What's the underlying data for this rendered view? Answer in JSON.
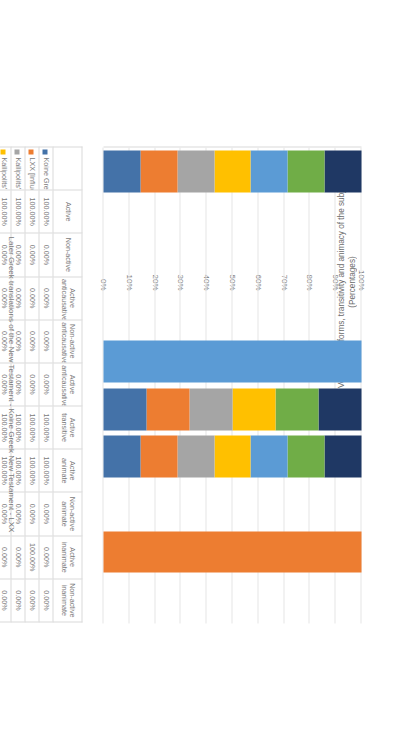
{
  "chart_data": {
    "type": "bar",
    "stacked": true,
    "title": "Later Greek translations of the New Testament - Koine Greek New Testament - LXX",
    "xlabel": "",
    "ylabel": "Voice verbal forms, transitivity and animacy of the subjects (Percentages)",
    "ylim": [
      0,
      100
    ],
    "ytick_labels": [
      "100%",
      "90%",
      "80%",
      "70%",
      "60%",
      "50%",
      "40%",
      "30%",
      "20%",
      "10%",
      "0%"
    ],
    "ytick_values": [
      100,
      90,
      80,
      70,
      60,
      50,
      40,
      30,
      20,
      10,
      0
    ],
    "grid": true,
    "legend_position": "bottom",
    "categories": [
      "Active",
      "Non-active",
      "Active anticausative",
      "Non-active anticausative",
      "Active anticausative",
      "Active transitive",
      "Active animate",
      "Non-active animate",
      "Active inanimate",
      "Non-active inanimate"
    ],
    "series": [
      {
        "name": "Koine Greek New Testament  [Source text]",
        "color": "#4472a8",
        "values": [
          100.0,
          0.0,
          0.0,
          0.0,
          0.0,
          100.0,
          100.0,
          0.0,
          0.0,
          0.0
        ]
      },
      {
        "name": "LXX [Influence on the source and target texts]",
        "color": "#ed7d31",
        "values": [
          100.0,
          0.0,
          0.0,
          0.0,
          0.0,
          100.0,
          100.0,
          0.0,
          100.0,
          0.0
        ]
      },
      {
        "name": "Kallipolits' New Testament  [17th century]",
        "color": "#a5a5a5",
        "values": [
          100.0,
          0.0,
          0.0,
          0.0,
          0.0,
          100.0,
          100.0,
          0.0,
          0.0,
          0.0
        ]
      },
      {
        "name": "Kallipolits' New Testament  [iatrevo] [17th century]",
        "color": "#ffc000",
        "values": [
          100.0,
          0.0,
          0.0,
          0.0,
          0.0,
          100.0,
          100.0,
          0.0,
          0.0,
          0.0
        ]
      },
      {
        "name": "Vamvas' New Testament  [19th century]",
        "color": "#5b9bd5",
        "values": [
          100.0,
          0.0,
          0.0,
          0.0,
          100.0,
          0.0,
          100.0,
          0.0,
          0.0,
          0.0
        ]
      },
      {
        "name": "Today's Greek Version  [20th century]",
        "color": "#70ad47",
        "values": [
          100.0,
          0.0,
          0.0,
          0.0,
          0.0,
          100.0,
          100.0,
          0.0,
          0.0,
          0.0
        ]
      },
      {
        "name": "Today's Greek Version [giatrevo] [20th century]",
        "color": "#1f3864",
        "values": [
          100.0,
          0.0,
          0.0,
          0.0,
          0.0,
          100.0,
          100.0,
          0.0,
          0.0,
          0.0
        ]
      }
    ]
  },
  "table": {
    "columns": [
      "Active",
      "Non-active",
      "Active anticausative",
      "Non-active anticausative",
      "Active anticausative",
      "Active transitive",
      "Active animate",
      "Non-active animate",
      "Active inanimate",
      "Non-active inanimate"
    ],
    "rows": [
      {
        "label": "Koine Greek New Testament  [Source text]",
        "color": "#4472a8",
        "cells": [
          "100.00%",
          "0.00%",
          "0.00%",
          "0.00%",
          "0.00%",
          "100.00%",
          "100.00%",
          "0.00%",
          "0.00%",
          "0.00%"
        ]
      },
      {
        "label": "LXX [Influence on the source and target texts]",
        "color": "#ed7d31",
        "cells": [
          "100.00%",
          "0.00%",
          "0.00%",
          "0.00%",
          "0.00%",
          "100.00%",
          "100.00%",
          "0.00%",
          "100.00%",
          "0.00%"
        ]
      },
      {
        "label": "Kallipolits' New Testament  [17th century]",
        "color": "#a5a5a5",
        "cells": [
          "100.00%",
          "0.00%",
          "0.00%",
          "0.00%",
          "0.00%",
          "100.00%",
          "100.00%",
          "0.00%",
          "0.00%",
          "0.00%"
        ]
      },
      {
        "label": "Kallipolits' New Testament  [iatrevo] [17th century]",
        "color": "#ffc000",
        "cells": [
          "100.00%",
          "0.00%",
          "0.00%",
          "0.00%",
          "0.00%",
          "100.00%",
          "100.00%",
          "0.00%",
          "0.00%",
          "0.00%"
        ]
      },
      {
        "label": "Vamvas' New Testament  [19th century]",
        "color": "#5b9bd5",
        "cells": [
          "100.00%",
          "0.00%",
          "0.00%",
          "0.00%",
          "100.00%",
          "0.00%",
          "100.00%",
          "0.00%",
          "0.00%",
          "0.00%"
        ]
      },
      {
        "label": "Today's Greek Version  [20th century]",
        "color": "#70ad47",
        "cells": [
          "100.00%",
          "0.00%",
          "0.00%",
          "0.00%",
          "0.00%",
          "100.00%",
          "100.00%",
          "0.00%",
          "0.00%",
          "0.00%"
        ]
      },
      {
        "label": "Today's Greek Version [giatrevo] [20th century]",
        "color": "#1f3864",
        "cells": [
          "100.00%",
          "0.00%",
          "0.00%",
          "0.00%",
          "0.00%",
          "100.00%",
          "100.00%",
          "0.00%",
          "0.00%",
          "0.00%"
        ]
      }
    ]
  },
  "colors": {
    "gridline": "#e6e6e6",
    "axis": "#d9d9d9",
    "text": "#7a7a7a"
  }
}
